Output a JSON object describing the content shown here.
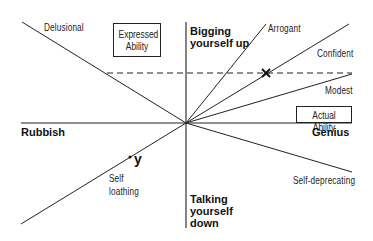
{
  "diagram": {
    "axes": {
      "x_axis_box_label": "Actual Ability",
      "y_axis_box_label_line1": "Expressed",
      "y_axis_box_label_line2": "Ability",
      "x_negative_label": "Rubbish",
      "x_positive_label": "Genius",
      "y_positive_label_line1": "Bigging",
      "y_positive_label_line2": "yourself up",
      "y_negative_label_line1": "Talking",
      "y_negative_label_line2": "yourself",
      "y_negative_label_line3": "down"
    },
    "lines": {
      "delusional": "Delusional",
      "arrogant": "Arrogant",
      "confident": "Confident",
      "modest": "Modest",
      "self_deprecating": "Self-deprecating",
      "self_loathing_line1": "Self",
      "self_loathing_line2": "loathing"
    },
    "markers": {
      "x_marker": "×",
      "y_marker": "y"
    },
    "colors": {
      "line": "#222222",
      "background": "#ffffff"
    }
  }
}
